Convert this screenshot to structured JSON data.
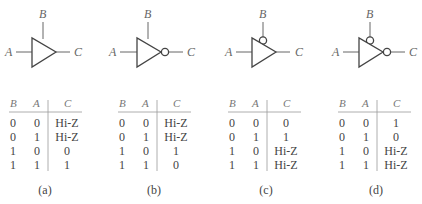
{
  "figure": {
    "panels": [
      {
        "caption": "(a)",
        "offset": 0,
        "labels": {
          "enable": "B",
          "input": "A",
          "output": "C"
        },
        "enable_bubble": false,
        "output_bubble": false,
        "table": {
          "headers": [
            "B",
            "A",
            "C"
          ],
          "rows": [
            [
              "0",
              "0",
              "Hi-Z"
            ],
            [
              "0",
              "1",
              "Hi-Z"
            ],
            [
              "1",
              "0",
              "0"
            ],
            [
              "1",
              "1",
              "1"
            ]
          ]
        }
      },
      {
        "caption": "(b)",
        "offset": 105,
        "labels": {
          "enable": "B",
          "input": "A",
          "output": "C"
        },
        "enable_bubble": false,
        "output_bubble": true,
        "table": {
          "headers": [
            "B",
            "A",
            "C"
          ],
          "rows": [
            [
              "0",
              "0",
              "Hi-Z"
            ],
            [
              "0",
              "1",
              "Hi-Z"
            ],
            [
              "1",
              "0",
              "1"
            ],
            [
              "1",
              "1",
              "0"
            ]
          ]
        }
      },
      {
        "caption": "(c)",
        "offset": 210,
        "labels": {
          "enable": "B",
          "input": "A",
          "output": "C"
        },
        "enable_bubble": true,
        "output_bubble": false,
        "table": {
          "headers": [
            "B",
            "A",
            "C"
          ],
          "rows": [
            [
              "0",
              "0",
              "0"
            ],
            [
              "0",
              "1",
              "1"
            ],
            [
              "1",
              "0",
              "Hi-Z"
            ],
            [
              "1",
              "1",
              "Hi-Z"
            ]
          ]
        }
      },
      {
        "caption": "(d)",
        "offset": 312,
        "labels": {
          "enable": "B",
          "input": "A",
          "output": "C"
        },
        "enable_bubble": true,
        "output_bubble": true,
        "table": {
          "headers": [
            "B",
            "A",
            "C"
          ],
          "rows": [
            [
              "0",
              "0",
              "1"
            ],
            [
              "0",
              "1",
              "0"
            ],
            [
              "1",
              "0",
              "Hi-Z"
            ],
            [
              "1",
              "1",
              "Hi-Z"
            ]
          ]
        }
      }
    ]
  }
}
